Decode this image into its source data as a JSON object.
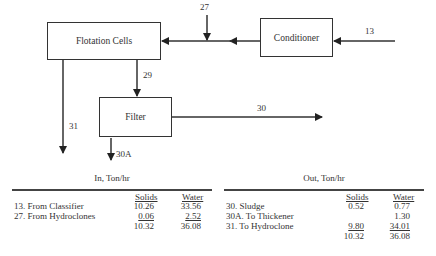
{
  "diagram": {
    "nodes": {
      "flotation": "Flotation Cells",
      "conditioner": "Conditioner",
      "filter": "Filter"
    },
    "streams": {
      "s13": "13",
      "s27": "27",
      "s29": "29",
      "s30": "30",
      "s30a": "30A",
      "s31": "31"
    }
  },
  "tables": {
    "in": {
      "title": "In, Ton/hr",
      "headers": {
        "solids": "Solids",
        "water": "Water"
      },
      "rows": [
        {
          "label": "13.  From Classifier",
          "solids": "10.26",
          "water": "33.56"
        },
        {
          "label": "27.  From Hydroclones",
          "solids": "0.06",
          "water": "2.52"
        }
      ],
      "total": {
        "solids": "10.32",
        "water": "36.08"
      }
    },
    "out": {
      "title": "Out, Ton/hr",
      "headers": {
        "solids": "Solids",
        "water": "Water"
      },
      "rows": [
        {
          "label": "30. Sludge",
          "solids": "0.52",
          "water": "0.77"
        },
        {
          "label": "30A.  To Thickener",
          "solids": "",
          "water": "1.30"
        },
        {
          "label": "31.  To Hydroclone",
          "solids": "9.80",
          "water": "34.01"
        }
      ],
      "total": {
        "solids": "10.32",
        "water": "36.08"
      }
    }
  }
}
